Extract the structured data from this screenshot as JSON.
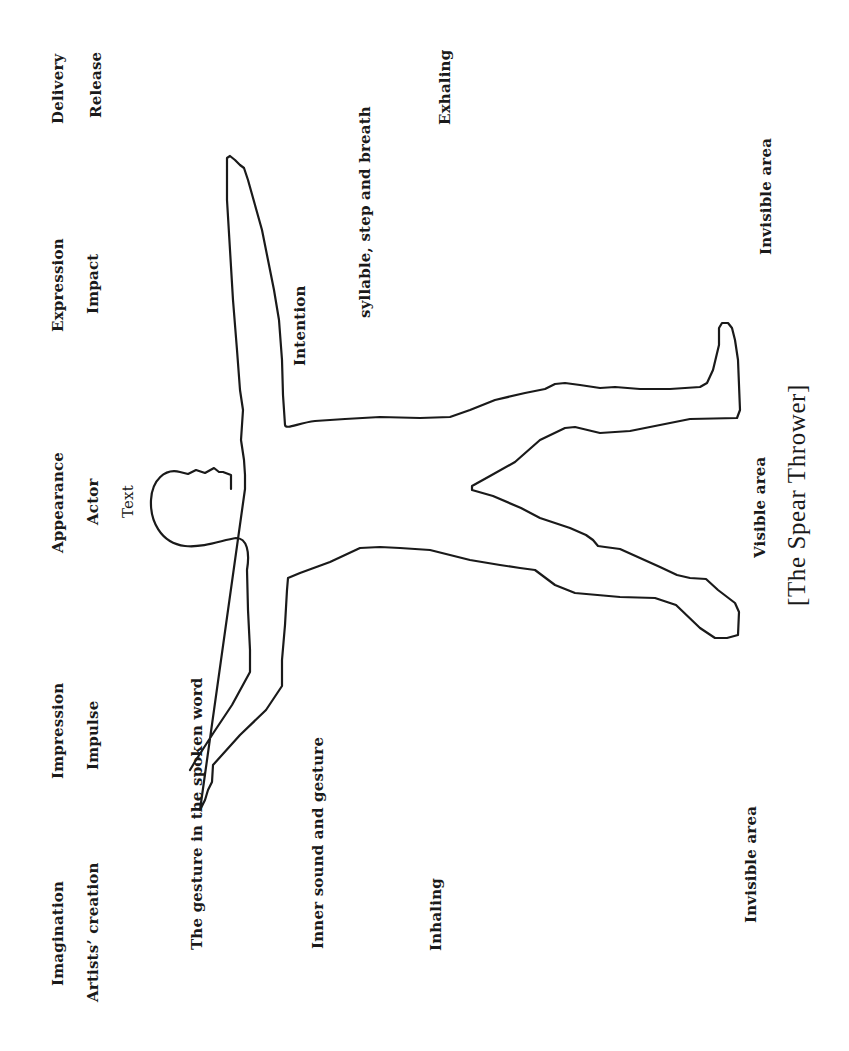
{
  "figure": {
    "caption": "[The Spear Thrower]",
    "outline_color": "#1a1a1a",
    "background": "#ffffff"
  },
  "columns": {
    "delivery": {
      "title": "Delivery",
      "sub": "Release"
    },
    "expression": {
      "title": "Expression",
      "sub": "Impact"
    },
    "appearance": {
      "title": "Appearance",
      "sub": "Actor",
      "sub2": "Text"
    },
    "impression": {
      "title": "Impression",
      "sub": "Impulse"
    },
    "imagination": {
      "title": "Imagination",
      "sub": "Artists’ creation"
    }
  },
  "labels": {
    "gesture_spoken_word": "The gesture in the spoken word",
    "intention": "Intention",
    "syllable_step_breath": "syllable, step and breath",
    "exhaling": "Exhaling",
    "inner_sound_gesture": "Inner sound and gesture",
    "inhaling": "Inhaling",
    "invisible_area_top": "Invisible area",
    "visible_area": "Visible area",
    "invisible_area_bottom": "Invisible area"
  }
}
